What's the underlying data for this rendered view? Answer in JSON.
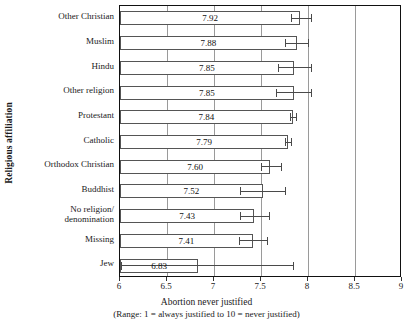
{
  "chart_data": {
    "type": "bar",
    "orientation": "horizontal",
    "title": "",
    "xlabel": "Abortion never justified",
    "xlabel_note": "(Range: 1 = always justified to 10 = never justified)",
    "ylabel": "Religious affiliation",
    "xlim": [
      6,
      9
    ],
    "xticks": [
      6,
      6.5,
      7,
      7.5,
      8,
      8.5,
      9
    ],
    "xticklabels": [
      "6",
      "6.5",
      "7",
      "7.5",
      "8",
      "8.5",
      "9"
    ],
    "grid": true,
    "gridlines_at": [
      6.5,
      7,
      7.5,
      8,
      8.5
    ],
    "legend": "none",
    "categories": [
      "Other Christian",
      "Muslim",
      "Hindu",
      "Other religion",
      "Protestant",
      "Catholic",
      "Orthodox Christian",
      "Buddhist",
      "No religion/\ndenomination",
      "Missing",
      "Jew"
    ],
    "values": [
      7.92,
      7.88,
      7.85,
      7.85,
      7.84,
      7.79,
      7.6,
      7.52,
      7.43,
      7.41,
      6.83
    ],
    "value_labels": [
      "7.92",
      "7.88",
      "7.85",
      "7.85",
      "7.84",
      "7.79",
      "7.60",
      "7.52",
      "7.43",
      "7.41",
      "6.83"
    ],
    "error_bars": [
      {
        "low": 7.82,
        "high": 8.03
      },
      {
        "low": 7.76,
        "high": 8.0
      },
      {
        "low": 7.68,
        "high": 8.03
      },
      {
        "low": 7.66,
        "high": 8.03
      },
      {
        "low": 7.81,
        "high": 7.87
      },
      {
        "low": 7.76,
        "high": 7.82
      },
      {
        "low": 7.5,
        "high": 7.71
      },
      {
        "low": 7.28,
        "high": 7.76
      },
      {
        "low": 7.28,
        "high": 7.58
      },
      {
        "low": 7.27,
        "high": 7.56
      },
      {
        "low": 6.01,
        "high": 7.84
      }
    ],
    "colors": {
      "bar_fill": "#ffffff",
      "bar_edge": "#555555",
      "error_bar": "#4a4a4a",
      "gridline": "#9a9a9a",
      "axis": "#111111",
      "text": "#1a1a1a"
    }
  }
}
